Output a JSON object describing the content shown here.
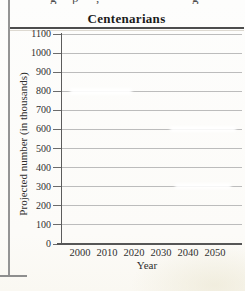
{
  "page": {
    "top_clipped_fragments": [
      "g",
      "p",
      ",",
      "g"
    ]
  },
  "chart_data": {
    "type": "line",
    "title": "Centenarians",
    "xlabel": "Year",
    "ylabel": "Projected number (in thousands)",
    "x_ticks": [
      2000,
      2010,
      2020,
      2030,
      2040,
      2050
    ],
    "y_ticks": [
      0,
      100,
      200,
      300,
      400,
      500,
      600,
      700,
      800,
      900,
      1000,
      1100
    ],
    "ylim": [
      0,
      1100
    ],
    "xlim": [
      1993,
      2060
    ],
    "grid": true,
    "legend_position": "none",
    "series": []
  }
}
